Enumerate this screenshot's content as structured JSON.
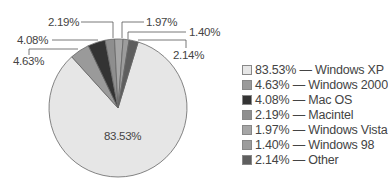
{
  "chart_data": {
    "type": "pie",
    "title": "",
    "slices": [
      {
        "label": "Windows XP",
        "value": 83.53,
        "display": "83.53%",
        "color": "#e6e6e6"
      },
      {
        "label": "Windows 2000",
        "value": 4.63,
        "display": "4.63%",
        "color": "#9a9a9a"
      },
      {
        "label": "Mac OS",
        "value": 4.08,
        "display": "4.08%",
        "color": "#333333"
      },
      {
        "label": "Macintel",
        "value": 2.19,
        "display": "2.19%",
        "color": "#8e8e8e"
      },
      {
        "label": "Windows Vista",
        "value": 1.97,
        "display": "1.97%",
        "color": "#a6a6a6"
      },
      {
        "label": "Windows 98",
        "value": 1.4,
        "display": "1.40%",
        "color": "#9c9c9c"
      },
      {
        "label": "Other",
        "value": 2.14,
        "display": "2.14%",
        "color": "#5e5e5e"
      }
    ],
    "legend_position": "right"
  },
  "legend": [
    {
      "text": "83.53% — Windows XP"
    },
    {
      "text": "4.63% — Windows 2000"
    },
    {
      "text": "4.08% — Mac OS"
    },
    {
      "text": "2.19% — Macintel"
    },
    {
      "text": "1.97% — Windows Vista"
    },
    {
      "text": "1.40% — Windows 98"
    },
    {
      "text": "2.14% — Other"
    }
  ],
  "labels": {
    "xp": "83.53%",
    "w2000": "4.63%",
    "macos": "4.08%",
    "macintel": "2.19%",
    "vista": "1.97%",
    "w98": "1.40%",
    "other": "2.14%"
  }
}
